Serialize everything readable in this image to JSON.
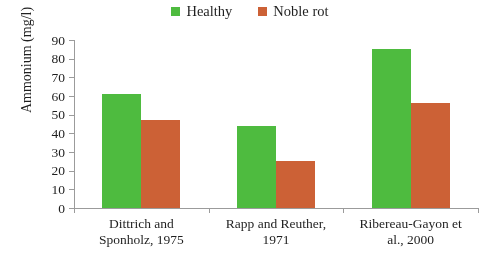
{
  "legend": {
    "entries": [
      {
        "label": "Healthy",
        "color": "#4CBB3C",
        "icon": "square-swatch-icon"
      },
      {
        "label": "Noble rot",
        "color": "#CC5F33",
        "icon": "square-swatch-icon"
      }
    ]
  },
  "axes": {
    "y_title": "Ammonium (mg/l)",
    "y_ticks": [
      "0",
      "10",
      "20",
      "30",
      "40",
      "50",
      "60",
      "70",
      "80",
      "90"
    ]
  },
  "categories": [
    {
      "line1": "Dittrich and",
      "line2": "Sponholz, 1975"
    },
    {
      "line1": "Rapp and Reuther,",
      "line2": "1971"
    },
    {
      "line1": "Ribereau-Gayon et",
      "line2": "al., 2000"
    }
  ],
  "chart_data": {
    "type": "bar",
    "title": "",
    "xlabel": "",
    "ylabel": "Ammonium (mg/l)",
    "ylim": [
      0,
      90
    ],
    "ytick_step": 10,
    "grid": false,
    "legend_position": "top-center",
    "categories": [
      "Dittrich and Sponholz, 1975",
      "Rapp and Reuther, 1971",
      "Ribereau-Gayon et al., 2000"
    ],
    "series": [
      {
        "name": "Healthy",
        "color": "#4CBB3C",
        "values": [
          61,
          44,
          85
        ]
      },
      {
        "name": "Noble rot",
        "color": "#CC5F33",
        "values": [
          47,
          25,
          56
        ]
      }
    ]
  }
}
